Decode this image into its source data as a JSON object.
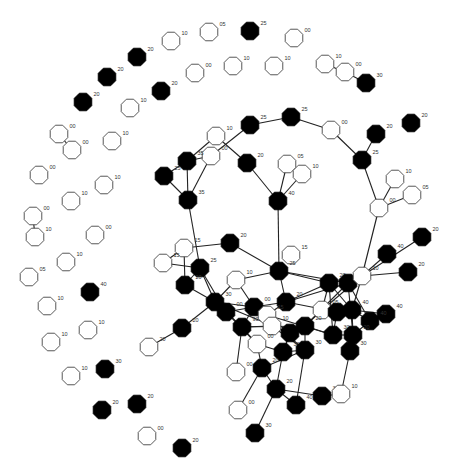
{
  "diagram": {
    "type": "network-graph",
    "legend": {
      "filled": "#000000",
      "open": "#ffffff"
    },
    "nodes": [
      {
        "id": "n1",
        "x": 250,
        "y": 31,
        "filled": true,
        "label": "25"
      },
      {
        "id": "n2",
        "x": 209,
        "y": 32,
        "filled": false,
        "label": "05"
      },
      {
        "id": "n3",
        "x": 294,
        "y": 38,
        "filled": false,
        "label": "00"
      },
      {
        "id": "n4",
        "x": 171,
        "y": 41,
        "filled": false,
        "label": "10"
      },
      {
        "id": "n5",
        "x": 137,
        "y": 57,
        "filled": true,
        "label": "20"
      },
      {
        "id": "n6",
        "x": 233,
        "y": 66,
        "filled": false,
        "label": "10"
      },
      {
        "id": "n7",
        "x": 274,
        "y": 66,
        "filled": false,
        "label": "10"
      },
      {
        "id": "n8",
        "x": 195,
        "y": 73,
        "filled": false,
        "label": "00"
      },
      {
        "id": "n9",
        "x": 107,
        "y": 77,
        "filled": true,
        "label": "20"
      },
      {
        "id": "n10",
        "x": 325,
        "y": 64,
        "filled": false,
        "label": "10"
      },
      {
        "id": "n11",
        "x": 345,
        "y": 72,
        "filled": false,
        "label": "00"
      },
      {
        "id": "n12",
        "x": 366,
        "y": 83,
        "filled": true,
        "label": "30"
      },
      {
        "id": "n13",
        "x": 161,
        "y": 91,
        "filled": true,
        "label": "20"
      },
      {
        "id": "n14",
        "x": 83,
        "y": 102,
        "filled": true,
        "label": "20"
      },
      {
        "id": "n15",
        "x": 130,
        "y": 108,
        "filled": false,
        "label": "10"
      },
      {
        "id": "n16",
        "x": 59,
        "y": 134,
        "filled": false,
        "label": "00"
      },
      {
        "id": "n17",
        "x": 72,
        "y": 150,
        "filled": false,
        "label": "00"
      },
      {
        "id": "n18",
        "x": 112,
        "y": 141,
        "filled": false,
        "label": "10"
      },
      {
        "id": "n19",
        "x": 39,
        "y": 175,
        "filled": false,
        "label": "00"
      },
      {
        "id": "n20",
        "x": 104,
        "y": 185,
        "filled": false,
        "label": "10"
      },
      {
        "id": "n21",
        "x": 71,
        "y": 201,
        "filled": false,
        "label": "10"
      },
      {
        "id": "n22",
        "x": 33,
        "y": 216,
        "filled": false,
        "label": "00"
      },
      {
        "id": "n23",
        "x": 35,
        "y": 237,
        "filled": false,
        "label": "10"
      },
      {
        "id": "n24",
        "x": 95,
        "y": 235,
        "filled": false,
        "label": "00"
      },
      {
        "id": "n25",
        "x": 66,
        "y": 262,
        "filled": false,
        "label": "10"
      },
      {
        "id": "n26",
        "x": 29,
        "y": 277,
        "filled": false,
        "label": "05"
      },
      {
        "id": "n27",
        "x": 90,
        "y": 292,
        "filled": true,
        "label": "40"
      },
      {
        "id": "n28",
        "x": 47,
        "y": 306,
        "filled": false,
        "label": "10"
      },
      {
        "id": "n29",
        "x": 88,
        "y": 330,
        "filled": false,
        "label": "10"
      },
      {
        "id": "n30",
        "x": 51,
        "y": 342,
        "filled": false,
        "label": "10"
      },
      {
        "id": "n31",
        "x": 105,
        "y": 369,
        "filled": true,
        "label": "30"
      },
      {
        "id": "n32",
        "x": 71,
        "y": 376,
        "filled": false,
        "label": "10"
      },
      {
        "id": "n33",
        "x": 102,
        "y": 410,
        "filled": true,
        "label": "20"
      },
      {
        "id": "n34",
        "x": 137,
        "y": 404,
        "filled": true,
        "label": "20"
      },
      {
        "id": "n35",
        "x": 147,
        "y": 436,
        "filled": false,
        "label": "00"
      },
      {
        "id": "n36",
        "x": 182,
        "y": 448,
        "filled": true,
        "label": "20"
      },
      {
        "id": "c1",
        "x": 250,
        "y": 125,
        "filled": true,
        "label": "25"
      },
      {
        "id": "c2",
        "x": 291,
        "y": 117,
        "filled": true,
        "label": "25"
      },
      {
        "id": "c3",
        "x": 331,
        "y": 130,
        "filled": false,
        "label": "00"
      },
      {
        "id": "c4",
        "x": 376,
        "y": 134,
        "filled": true,
        "label": "20"
      },
      {
        "id": "c5",
        "x": 411,
        "y": 123,
        "filled": true,
        "label": "20"
      },
      {
        "id": "c6",
        "x": 362,
        "y": 160,
        "filled": true,
        "label": "25"
      },
      {
        "id": "c7",
        "x": 216,
        "y": 136,
        "filled": false,
        "label": "10"
      },
      {
        "id": "c8",
        "x": 211,
        "y": 156,
        "filled": false,
        "label": "00"
      },
      {
        "id": "c9",
        "x": 187,
        "y": 161,
        "filled": true,
        "label": "35"
      },
      {
        "id": "c10",
        "x": 164,
        "y": 176,
        "filled": true,
        "label": "25"
      },
      {
        "id": "c11",
        "x": 247,
        "y": 163,
        "filled": true,
        "label": "20"
      },
      {
        "id": "c12",
        "x": 287,
        "y": 164,
        "filled": false,
        "label": "05"
      },
      {
        "id": "c13",
        "x": 302,
        "y": 174,
        "filled": false,
        "label": "10"
      },
      {
        "id": "c14",
        "x": 188,
        "y": 200,
        "filled": true,
        "label": "35"
      },
      {
        "id": "c15",
        "x": 278,
        "y": 201,
        "filled": true,
        "label": "40"
      },
      {
        "id": "c16",
        "x": 395,
        "y": 179,
        "filled": false,
        "label": "10"
      },
      {
        "id": "c17",
        "x": 412,
        "y": 195,
        "filled": false,
        "label": "05"
      },
      {
        "id": "c18",
        "x": 379,
        "y": 208,
        "filled": false,
        "label": "00"
      },
      {
        "id": "c19",
        "x": 230,
        "y": 243,
        "filled": true,
        "label": "20"
      },
      {
        "id": "c20",
        "x": 422,
        "y": 237,
        "filled": true,
        "label": "20"
      },
      {
        "id": "c21",
        "x": 184,
        "y": 248,
        "filled": false,
        "label": "15"
      },
      {
        "id": "c22",
        "x": 163,
        "y": 263,
        "filled": false,
        "label": "15"
      },
      {
        "id": "c23",
        "x": 291,
        "y": 255,
        "filled": false,
        "label": "15"
      },
      {
        "id": "c24",
        "x": 387,
        "y": 254,
        "filled": true,
        "label": "40"
      },
      {
        "id": "c25",
        "x": 200,
        "y": 268,
        "filled": true,
        "label": "25"
      },
      {
        "id": "c26",
        "x": 279,
        "y": 271,
        "filled": true,
        "label": "25"
      },
      {
        "id": "c27",
        "x": 236,
        "y": 280,
        "filled": false,
        "label": "10"
      },
      {
        "id": "c28",
        "x": 185,
        "y": 285,
        "filled": true,
        "label": "20"
      },
      {
        "id": "c29",
        "x": 408,
        "y": 272,
        "filled": true,
        "label": "20"
      },
      {
        "id": "c30",
        "x": 329,
        "y": 283,
        "filled": true,
        "label": "20"
      },
      {
        "id": "c31",
        "x": 348,
        "y": 283,
        "filled": true,
        "label": "25"
      },
      {
        "id": "c32",
        "x": 362,
        "y": 276,
        "filled": false,
        "label": "10"
      },
      {
        "id": "c33",
        "x": 215,
        "y": 302,
        "filled": true,
        "label": "30"
      },
      {
        "id": "c34",
        "x": 226,
        "y": 312,
        "filled": true,
        "label": "00"
      },
      {
        "id": "c35",
        "x": 286,
        "y": 302,
        "filled": true,
        "label": "20"
      },
      {
        "id": "c36",
        "x": 254,
        "y": 307,
        "filled": true,
        "label": "00"
      },
      {
        "id": "c37",
        "x": 267,
        "y": 315,
        "filled": false,
        "label": "15"
      },
      {
        "id": "c38",
        "x": 322,
        "y": 310,
        "filled": false,
        "label": "05"
      },
      {
        "id": "c39",
        "x": 337,
        "y": 312,
        "filled": true,
        "label": "30"
      },
      {
        "id": "c40",
        "x": 352,
        "y": 310,
        "filled": true,
        "label": "40"
      },
      {
        "id": "c41",
        "x": 386,
        "y": 314,
        "filled": true,
        "label": "40"
      },
      {
        "id": "c42",
        "x": 370,
        "y": 321,
        "filled": true,
        "label": "40"
      },
      {
        "id": "c43",
        "x": 182,
        "y": 328,
        "filled": true,
        "label": "20"
      },
      {
        "id": "c44",
        "x": 242,
        "y": 327,
        "filled": true,
        "label": "90"
      },
      {
        "id": "c45",
        "x": 272,
        "y": 326,
        "filled": false,
        "label": "10"
      },
      {
        "id": "c46",
        "x": 290,
        "y": 333,
        "filled": true,
        "label": "15"
      },
      {
        "id": "c47",
        "x": 305,
        "y": 326,
        "filled": true,
        "label": "20"
      },
      {
        "id": "c48",
        "x": 333,
        "y": 335,
        "filled": true,
        "label": "30"
      },
      {
        "id": "c49",
        "x": 353,
        "y": 335,
        "filled": true,
        "label": "20"
      },
      {
        "id": "c50",
        "x": 257,
        "y": 344,
        "filled": false,
        "label": "00"
      },
      {
        "id": "c51",
        "x": 283,
        "y": 352,
        "filled": true,
        "label": "30"
      },
      {
        "id": "c52",
        "x": 305,
        "y": 350,
        "filled": true,
        "label": "30"
      },
      {
        "id": "c53",
        "x": 350,
        "y": 351,
        "filled": true,
        "label": "30"
      },
      {
        "id": "c54",
        "x": 149,
        "y": 347,
        "filled": false,
        "label": "20"
      },
      {
        "id": "c55",
        "x": 262,
        "y": 368,
        "filled": true,
        "label": "20"
      },
      {
        "id": "c56",
        "x": 236,
        "y": 372,
        "filled": false,
        "label": "00"
      },
      {
        "id": "c57",
        "x": 276,
        "y": 389,
        "filled": true,
        "label": "20"
      },
      {
        "id": "c58",
        "x": 322,
        "y": 396,
        "filled": true,
        "label": "30"
      },
      {
        "id": "c59",
        "x": 341,
        "y": 394,
        "filled": false,
        "label": "10"
      },
      {
        "id": "c60",
        "x": 296,
        "y": 405,
        "filled": true,
        "label": "40"
      },
      {
        "id": "c61",
        "x": 238,
        "y": 410,
        "filled": false,
        "label": "00"
      },
      {
        "id": "c62",
        "x": 255,
        "y": 433,
        "filled": true,
        "label": "30"
      }
    ],
    "edges": [
      [
        "n10",
        "n11"
      ],
      [
        "n11",
        "n12"
      ],
      [
        "n16",
        "n17"
      ],
      [
        "n22",
        "n23"
      ],
      [
        "c1",
        "c2"
      ],
      [
        "c2",
        "c3"
      ],
      [
        "c3",
        "c6"
      ],
      [
        "c4",
        "c6"
      ],
      [
        "c6",
        "c18"
      ],
      [
        "c16",
        "c18"
      ],
      [
        "c17",
        "c18"
      ],
      [
        "c18",
        "c32"
      ],
      [
        "c1",
        "c8"
      ],
      [
        "c7",
        "c11"
      ],
      [
        "c7",
        "c9"
      ],
      [
        "c8",
        "c9"
      ],
      [
        "c8",
        "c14"
      ],
      [
        "c9",
        "c10"
      ],
      [
        "c9",
        "c14"
      ],
      [
        "c10",
        "c14"
      ],
      [
        "c11",
        "c15"
      ],
      [
        "c12",
        "c15"
      ],
      [
        "c13",
        "c15"
      ],
      [
        "c15",
        "c26"
      ],
      [
        "c14",
        "c25"
      ],
      [
        "c19",
        "c21"
      ],
      [
        "c21",
        "c22"
      ],
      [
        "c21",
        "c28"
      ],
      [
        "c22",
        "c25"
      ],
      [
        "c25",
        "c28"
      ],
      [
        "c25",
        "c33"
      ],
      [
        "c25",
        "c34"
      ],
      [
        "c19",
        "c26"
      ],
      [
        "c26",
        "c27"
      ],
      [
        "c26",
        "c30"
      ],
      [
        "c26",
        "c31"
      ],
      [
        "c27",
        "c33"
      ],
      [
        "c28",
        "c33"
      ],
      [
        "c33",
        "c36"
      ],
      [
        "c33",
        "c43"
      ],
      [
        "c43",
        "c54"
      ],
      [
        "c24",
        "c32"
      ],
      [
        "c20",
        "c32"
      ],
      [
        "c29",
        "c32"
      ],
      [
        "c32",
        "c30"
      ],
      [
        "c32",
        "c31"
      ],
      [
        "c32",
        "c38"
      ],
      [
        "c32",
        "c40"
      ],
      [
        "c30",
        "c35"
      ],
      [
        "c31",
        "c35"
      ],
      [
        "c35",
        "c36"
      ],
      [
        "c35",
        "c37"
      ],
      [
        "c34",
        "c36"
      ],
      [
        "c34",
        "c44"
      ],
      [
        "c36",
        "c44"
      ],
      [
        "c36",
        "c46"
      ],
      [
        "c37",
        "c45"
      ],
      [
        "c38",
        "c39"
      ],
      [
        "c39",
        "c40"
      ],
      [
        "c40",
        "c41"
      ],
      [
        "c40",
        "c42"
      ],
      [
        "c39",
        "c48"
      ],
      [
        "c40",
        "c49"
      ],
      [
        "c42",
        "c49"
      ],
      [
        "c48",
        "c49"
      ],
      [
        "c38",
        "c47"
      ],
      [
        "c47",
        "c48"
      ],
      [
        "c44",
        "c45"
      ],
      [
        "c44",
        "c50"
      ],
      [
        "c45",
        "c46"
      ],
      [
        "c46",
        "c47"
      ],
      [
        "c46",
        "c51"
      ],
      [
        "c47",
        "c52"
      ],
      [
        "c50",
        "c51"
      ],
      [
        "c51",
        "c52"
      ],
      [
        "c50",
        "c55"
      ],
      [
        "c44",
        "c56"
      ],
      [
        "c52",
        "c55"
      ],
      [
        "c49",
        "c53"
      ],
      [
        "c53",
        "c59"
      ],
      [
        "c55",
        "c57"
      ],
      [
        "c57",
        "c60"
      ],
      [
        "c57",
        "c58"
      ],
      [
        "c58",
        "c59"
      ],
      [
        "c57",
        "c62"
      ],
      [
        "c51",
        "c57"
      ],
      [
        "c52",
        "c60"
      ],
      [
        "c55",
        "c61"
      ],
      [
        "c30",
        "c48"
      ],
      [
        "c31",
        "c47"
      ],
      [
        "c35",
        "c39"
      ],
      [
        "c26",
        "c35"
      ],
      [
        "c33",
        "c46"
      ],
      [
        "c34",
        "c50"
      ],
      [
        "c36",
        "c52"
      ],
      [
        "c30",
        "c38"
      ],
      [
        "c31",
        "c42"
      ],
      [
        "c44",
        "c47"
      ],
      [
        "c45",
        "c52"
      ],
      [
        "c27",
        "c36"
      ],
      [
        "c37",
        "c48"
      ],
      [
        "c30",
        "c40"
      ],
      [
        "c31",
        "c49"
      ]
    ]
  }
}
